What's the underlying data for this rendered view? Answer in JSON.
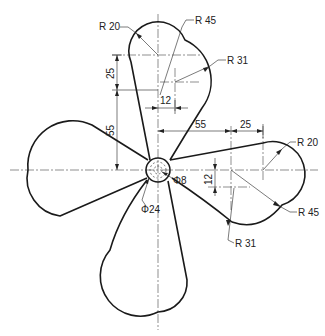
{
  "diagram": {
    "type": "engineering-drawing",
    "hub": {
      "outer_diameter_label": "Φ24",
      "inner_diameter_label": "Φ8"
    },
    "top_blade": {
      "tip_radius_label": "R 20",
      "outer_radius_label": "R 45",
      "inner_radius_label": "R 31",
      "vertical_offset_label": "25",
      "hub_distance_label": "55",
      "horizontal_offset_label": "12"
    },
    "right_blade": {
      "tip_radius_label": "R 20",
      "outer_radius_label": "R 45",
      "inner_radius_label": "R 31",
      "horizontal_offset_label": "25",
      "hub_distance_label": "55",
      "vertical_offset_label": "12"
    },
    "colors": {
      "line": "#1a1a1a",
      "background": "#ffffff"
    }
  }
}
